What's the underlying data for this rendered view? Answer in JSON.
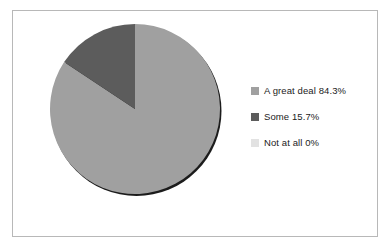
{
  "chart_data": {
    "type": "pie",
    "title": "",
    "categories": [
      "A great deal",
      "Some",
      "Not at all"
    ],
    "values": [
      84.3,
      15.7,
      0
    ],
    "value_unit": "%",
    "legend_position": "right",
    "grid": false,
    "start_angle_deg": 0,
    "direction": "clockwise",
    "slices": [
      {
        "label": "A great deal",
        "value": 84.3,
        "display": "84.3%",
        "color": "#a0a0a0",
        "start_deg": 0,
        "sweep_deg": 303.48
      },
      {
        "label": "Some",
        "value": 15.7,
        "display": "15.7%",
        "color": "#5c5c5c",
        "start_deg": 303.48,
        "sweep_deg": 56.52
      },
      {
        "label": "Not at all",
        "value": 0,
        "display": "0%",
        "color": "#e2e2e2",
        "start_deg": 360,
        "sweep_deg": 0
      }
    ]
  },
  "legend": {
    "items": [
      {
        "label": "A great deal 84.3%",
        "swatch_color": "#a0a0a0",
        "name": "legend-item-a-great-deal"
      },
      {
        "label": "Some 15.7%",
        "swatch_color": "#5c5c5c",
        "name": "legend-item-some"
      },
      {
        "label": "Not at all 0%",
        "swatch_color": "#e2e2e2",
        "name": "legend-item-not-at-all"
      }
    ]
  },
  "style": {
    "frame_border_color": "#b8b8b8",
    "background_color": "#ffffff",
    "shadow_color": "#1c1c1c",
    "label_color": "#1b1b1b"
  }
}
